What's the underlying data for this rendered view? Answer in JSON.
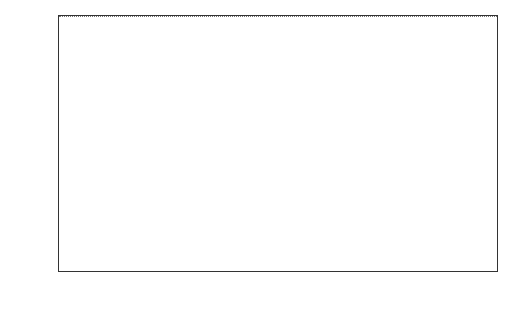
{
  "chart_data": {
    "type": "bar",
    "title": "",
    "xlabel": "",
    "ylabel": "No. of trips",
    "ylim": [
      0,
      160
    ],
    "yticks": [
      0,
      20,
      40,
      60,
      80,
      100,
      120,
      140,
      160
    ],
    "categories": [
      "JAN",
      "FEB",
      "MAR",
      "APR",
      "MAY",
      "JUN",
      "JUL",
      "AUG",
      "SEP",
      "OCT",
      "NOV",
      "DEC"
    ],
    "values": [
      82,
      24,
      38,
      86,
      110,
      112,
      125,
      120,
      146,
      150,
      79,
      81
    ],
    "reference_line": {
      "style": "dotted",
      "value": 96
    },
    "grid": false,
    "legend": null
  },
  "labels": {
    "ylabel": "No. of trips",
    "yticks": [
      "0",
      "20",
      "40",
      "60",
      "80",
      "100",
      "120",
      "140",
      "160"
    ]
  },
  "colors": {
    "bar_fill": "#999999",
    "bar_border": "#333333",
    "axis": "#333333"
  }
}
